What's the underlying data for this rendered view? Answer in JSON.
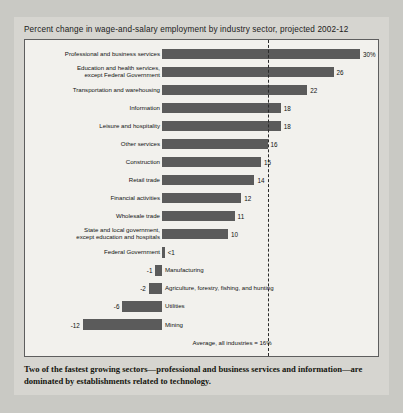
{
  "title": "Percent change in wage-and-salary employment by industry sector, projected 2002-12",
  "caption": "Two of the fastest growing sectors—professional and business services and information—are dominated by establishments related to technology.",
  "average_note": "Average, all industries = 16%",
  "colors": {
    "bar": "#5b5b5b",
    "page": "#d6d5d0",
    "plot": "#f2f1ed",
    "axis": "#2a2a2a"
  },
  "chart_data": {
    "type": "bar",
    "orientation": "horizontal",
    "title": "Percent change in wage-and-salary employment by industry sector, projected 2002-12",
    "xlabel": "",
    "ylabel": "",
    "xlim": [
      -12,
      30
    ],
    "grid": false,
    "legend": null,
    "annotations": [
      {
        "text": "Average, all industries = 16%",
        "value": 16,
        "style": "dashed-vertical-line"
      }
    ],
    "categories": [
      "Professional and business services",
      "Education and health services,\nexcept Federal Government",
      "Transportation and warehousing",
      "Information",
      "Leisure and hospitality",
      "Other services",
      "Construction",
      "Retail trade",
      "Financial activities",
      "Wholesale trade",
      "State and local government,\nexcept education and hospitals",
      "Federal Government",
      "Manufacturing",
      "Agriculture, forestry, fishing, and hunting",
      "Utilities",
      "Mining"
    ],
    "values": [
      30,
      26,
      22,
      18,
      18,
      16,
      15,
      14,
      12,
      11,
      10,
      0.4,
      -1,
      -2,
      -6,
      -12
    ],
    "value_labels": [
      "30%",
      "26",
      "22",
      "18",
      "18",
      "16",
      "15",
      "14",
      "12",
      "11",
      "10",
      "<1",
      "-1",
      "-2",
      "-6",
      "-12"
    ]
  }
}
